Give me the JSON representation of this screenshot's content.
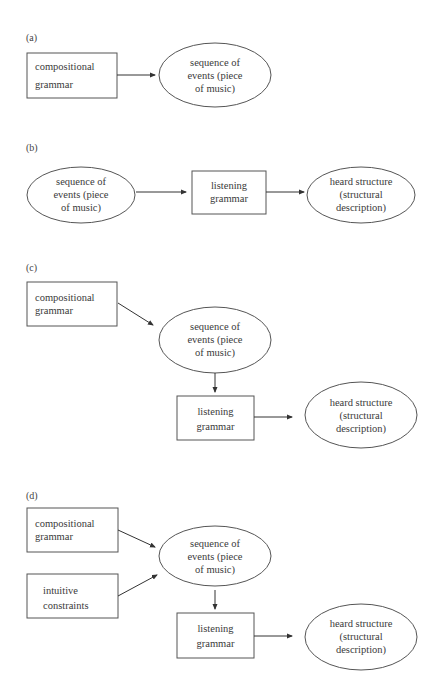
{
  "figure": {
    "panels": [
      {
        "label": "(a)",
        "nodes": {
          "compositional_grammar": [
            "compositional",
            "grammar"
          ],
          "sequence_of_events": [
            "sequence of",
            "events (piece",
            "of music)"
          ]
        }
      },
      {
        "label": "(b)",
        "nodes": {
          "sequence_of_events": [
            "sequence of",
            "events (piece",
            "of music)"
          ],
          "listening_grammar": [
            "listening",
            "grammar"
          ],
          "heard_structure": [
            "heard structure",
            "(structural",
            "description)"
          ]
        }
      },
      {
        "label": "(c)",
        "nodes": {
          "compositional_grammar": [
            "compositional",
            "grammar"
          ],
          "sequence_of_events": [
            "sequence of",
            "events (piece",
            "of music)"
          ],
          "listening_grammar": [
            "listening",
            "grammar"
          ],
          "heard_structure": [
            "heard structure",
            "(structural",
            "description)"
          ]
        }
      },
      {
        "label": "(d)",
        "nodes": {
          "compositional_grammar": [
            "compositional",
            "grammar"
          ],
          "intuitive_constraints": [
            "intuitive",
            "constraints"
          ],
          "sequence_of_events": [
            "sequence of",
            "events (piece",
            "of music)"
          ],
          "listening_grammar": [
            "listening",
            "grammar"
          ],
          "heard_structure": [
            "heard structure",
            "(structural",
            "description)"
          ]
        }
      }
    ],
    "colors": {
      "stroke": "#555555",
      "arrow": "#333333",
      "text": "#3a3a3a",
      "background": "#ffffff"
    }
  }
}
